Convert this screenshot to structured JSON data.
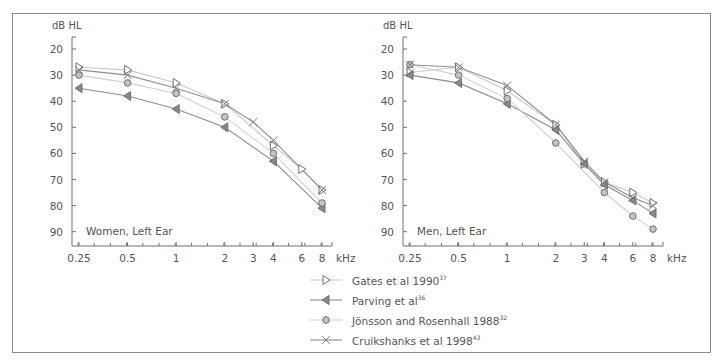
{
  "chart_data": [
    {
      "type": "line",
      "title": "Women, Left Ear",
      "ylabel": "dB HL",
      "xlabel": "kHz",
      "x_scale": "log",
      "x_ticks": [
        "0.25",
        "0.5",
        "1",
        "2",
        "3",
        "4",
        "6",
        "8"
      ],
      "y_ticks": [
        20,
        30,
        40,
        50,
        60,
        70,
        80,
        90
      ],
      "ylim": [
        95,
        15
      ],
      "y_inverted": true,
      "grid": false,
      "series": [
        {
          "name": "Gates et al 1990",
          "ref": "37",
          "marker": "triangle-right",
          "x": [
            0.25,
            0.5,
            1,
            2,
            4,
            6,
            8
          ],
          "values": [
            27,
            28,
            33,
            41,
            57,
            66,
            74
          ]
        },
        {
          "name": "Parving et al",
          "ref": "36",
          "marker": "triangle-left",
          "x": [
            0.25,
            0.5,
            1,
            2,
            4,
            8
          ],
          "values": [
            35,
            38,
            43,
            50,
            63,
            81
          ]
        },
        {
          "name": "Jönsson and Rosenhall 1988",
          "ref": "32",
          "marker": "circle",
          "x": [
            0.25,
            0.5,
            1,
            2,
            4,
            8
          ],
          "values": [
            30,
            33,
            37,
            46,
            60,
            79
          ]
        },
        {
          "name": "Cruikshanks et al 1998",
          "ref": "43",
          "marker": "cross",
          "x": [
            0.25,
            0.5,
            1,
            2,
            3,
            4,
            8
          ],
          "values": [
            28,
            30,
            35,
            41,
            48,
            55,
            74
          ]
        }
      ]
    },
    {
      "type": "line",
      "title": "Men, Left Ear",
      "ylabel": "dB HL",
      "xlabel": "kHz",
      "x_scale": "log",
      "x_ticks": [
        "0.25",
        "0.5",
        "1",
        "2",
        "3",
        "4",
        "6",
        "8"
      ],
      "y_ticks": [
        20,
        30,
        40,
        50,
        60,
        70,
        80,
        90
      ],
      "ylim": [
        95,
        15
      ],
      "y_inverted": true,
      "grid": false,
      "series": [
        {
          "name": "Gates et al 1990",
          "ref": "37",
          "marker": "triangle-right",
          "x": [
            0.25,
            0.5,
            1,
            2,
            3,
            4,
            6,
            8
          ],
          "values": [
            29,
            27,
            36,
            49,
            64,
            71,
            75,
            79
          ]
        },
        {
          "name": "Parving et al",
          "ref": "36",
          "marker": "triangle-left",
          "x": [
            0.25,
            0.5,
            1,
            2,
            3,
            4,
            6,
            8
          ],
          "values": [
            30,
            33,
            41,
            51,
            64,
            72,
            78,
            83
          ]
        },
        {
          "name": "Jönsson and Rosenhall 1988",
          "ref": "32",
          "marker": "circle",
          "x": [
            0.25,
            0.5,
            1,
            2,
            4,
            6,
            8
          ],
          "values": [
            26,
            30,
            39,
            56,
            75,
            84,
            89
          ]
        },
        {
          "name": "Cruikshanks et al 1998",
          "ref": "43",
          "marker": "cross",
          "x": [
            0.25,
            0.5,
            1,
            2,
            3,
            4,
            6,
            8
          ],
          "values": [
            26,
            27,
            34,
            49,
            63,
            71,
            77,
            80
          ]
        }
      ]
    }
  ],
  "legend": {
    "position": "bottom-center",
    "items": [
      {
        "label": "Gates et al 1990",
        "ref": "37",
        "marker": "triangle-right"
      },
      {
        "label": "Parving et al",
        "ref": "36",
        "marker": "triangle-left"
      },
      {
        "label": "Jönsson and Rosenhall 1988",
        "ref": "32",
        "marker": "circle"
      },
      {
        "label": "Cruikshanks et al 1998",
        "ref": "43",
        "marker": "cross"
      }
    ]
  },
  "colors": {
    "gates": "#c8c8c8",
    "parving": "#8c8c8c",
    "jonsson": "#d2d2d2",
    "cruikshanks": "#8f8f8f",
    "marker_stroke": "#707070",
    "circle_fill": "#c4c4c4",
    "axis": "#707070",
    "text": "#555555"
  }
}
